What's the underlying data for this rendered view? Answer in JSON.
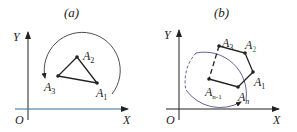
{
  "panels": [
    {
      "caption": "(a)",
      "axes": {
        "y_label": "Y",
        "x_label": "X",
        "origin_label": "O"
      },
      "points": [
        {
          "name": "A",
          "sub": "1"
        },
        {
          "name": "A",
          "sub": "2"
        },
        {
          "name": "A",
          "sub": "3"
        }
      ],
      "rotation_arrow": "counter-clockwise arc around triangle"
    },
    {
      "caption": "(b)",
      "axes": {
        "y_label": "Y",
        "x_label": "X",
        "origin_label": "O"
      },
      "points": [
        {
          "name": "A",
          "sub": "1"
        },
        {
          "name": "A",
          "sub": "2"
        },
        {
          "name": "A",
          "sub": "3"
        },
        {
          "name": "A",
          "sub": "n-1"
        },
        {
          "name": "A",
          "sub": "n"
        }
      ],
      "rotation_arrow": "arc around polygon"
    }
  ],
  "colors": {
    "stroke": "#222222",
    "x_axis_a": "#2a6fa0",
    "arc_b": "#3a3a8a",
    "accent_a2_b": "#2e8b3e"
  }
}
